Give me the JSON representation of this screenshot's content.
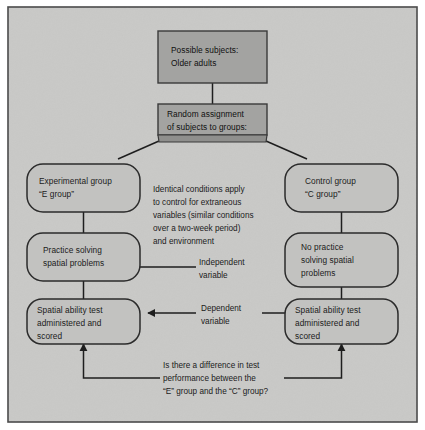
{
  "figure": {
    "colors": {
      "page_background": "#ffffff",
      "canvas_background": "#c9c9c7",
      "frame_border": "#4a4a4a",
      "process_box_fill": "#a3a3a1",
      "process_box_border": "#3a3a3a",
      "group_box_fill": "#c2c2c0",
      "group_box_border": "#2b2b2b",
      "connector": "#1e1e1e",
      "text": "#1b1b1b"
    }
  },
  "nodes": {
    "subjects": {
      "id": "possible-subjects",
      "shape": "rectangle",
      "lines": [
        "Possible subjects:",
        "Older adults"
      ]
    },
    "assignment": {
      "id": "random-assignment",
      "shape": "rectangle-beveled",
      "lines": [
        "Random assignment",
        "of subjects to groups:"
      ]
    },
    "experimental_group": {
      "id": "experimental-group",
      "shape": "rounded-rectangle",
      "lines": [
        "Experimental group",
        "“E group”"
      ]
    },
    "control_group": {
      "id": "control-group",
      "shape": "rounded-rectangle",
      "lines": [
        "Control group",
        "“C group”"
      ]
    },
    "practice": {
      "id": "practice-solving",
      "shape": "rounded-rectangle",
      "lines": [
        "Practice solving",
        "spatial problems"
      ]
    },
    "no_practice": {
      "id": "no-practice-solving",
      "shape": "rounded-rectangle",
      "lines": [
        "No practice",
        "solving spatial",
        "problems"
      ]
    },
    "test_left": {
      "id": "spatial-ability-test-experimental",
      "shape": "rounded-rectangle",
      "lines": [
        "Spatial ability test",
        "administered and",
        "scored"
      ]
    },
    "test_right": {
      "id": "spatial-ability-test-control",
      "shape": "rounded-rectangle",
      "lines": [
        "Spatial ability test",
        "administered and",
        "scored"
      ]
    }
  },
  "annotations": {
    "controls": {
      "id": "identical-conditions-note",
      "lines": [
        "Identical conditions apply",
        "to control for extraneous",
        "variables (similar conditions",
        "over a two-week period)",
        "and environment"
      ]
    },
    "independent_variable": {
      "id": "independent-variable-label",
      "lines": [
        "Independent",
        "variable"
      ]
    },
    "dependent_variable": {
      "id": "dependent-variable-label",
      "lines": [
        "Dependent",
        "variable"
      ]
    },
    "research_question": {
      "id": "research-question",
      "lines": [
        "Is there a difference in test",
        "performance between the",
        "“E” group and the “C” group?"
      ]
    }
  }
}
